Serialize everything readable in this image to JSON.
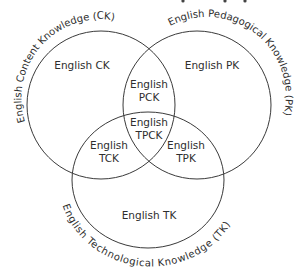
{
  "diagram": {
    "type": "venn",
    "circles": [
      {
        "id": "ck",
        "arc_label": "English Content Knowledge (CK)",
        "region_label": "English CK"
      },
      {
        "id": "pk",
        "arc_label": "English Pedagogical Knowledge (PK)",
        "region_label": "English PK"
      },
      {
        "id": "tk",
        "arc_label": "English Technological Knowledge (TK)",
        "region_label": "English TK"
      }
    ],
    "intersections": {
      "pck": {
        "line1": "English",
        "line2": "PCK"
      },
      "tck": {
        "line1": "English",
        "line2": "TCK"
      },
      "tpk": {
        "line1": "English",
        "line2": "TPK"
      },
      "tpck": {
        "line1": "English",
        "line2": "TPCK"
      }
    },
    "colors": {
      "stroke": "#3a3a3a",
      "text": "#2e2e2e",
      "background": "#ffffff"
    }
  }
}
